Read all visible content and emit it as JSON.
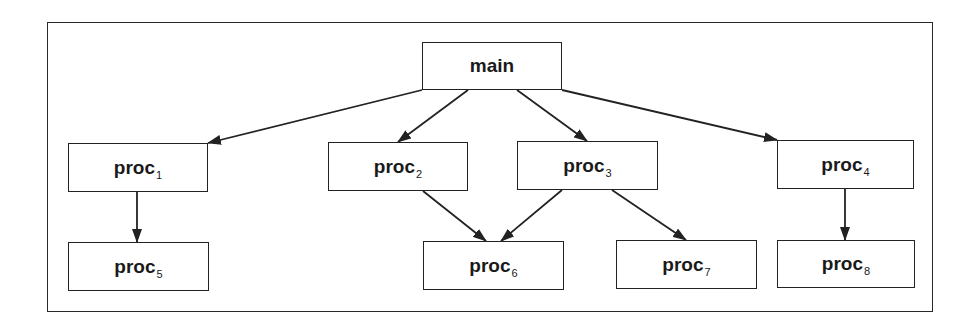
{
  "diagram": {
    "type": "call-graph",
    "colors": {
      "stroke": "#222222",
      "background": "#ffffff",
      "text": "#1a1a1a"
    },
    "nodes": [
      {
        "id": "main",
        "label": "main",
        "sub": ""
      },
      {
        "id": "proc1",
        "label": "proc",
        "sub": "1"
      },
      {
        "id": "proc2",
        "label": "proc",
        "sub": "2"
      },
      {
        "id": "proc3",
        "label": "proc",
        "sub": "3"
      },
      {
        "id": "proc4",
        "label": "proc",
        "sub": "4"
      },
      {
        "id": "proc5",
        "label": "proc",
        "sub": "5"
      },
      {
        "id": "proc6",
        "label": "proc",
        "sub": "6"
      },
      {
        "id": "proc7",
        "label": "proc",
        "sub": "7"
      },
      {
        "id": "proc8",
        "label": "proc",
        "sub": "8"
      }
    ],
    "edges": [
      {
        "from": "main",
        "to": "proc1"
      },
      {
        "from": "main",
        "to": "proc2"
      },
      {
        "from": "main",
        "to": "proc3"
      },
      {
        "from": "main",
        "to": "proc4"
      },
      {
        "from": "proc1",
        "to": "proc5"
      },
      {
        "from": "proc2",
        "to": "proc6"
      },
      {
        "from": "proc3",
        "to": "proc6"
      },
      {
        "from": "proc3",
        "to": "proc7"
      },
      {
        "from": "proc4",
        "to": "proc8"
      }
    ]
  }
}
